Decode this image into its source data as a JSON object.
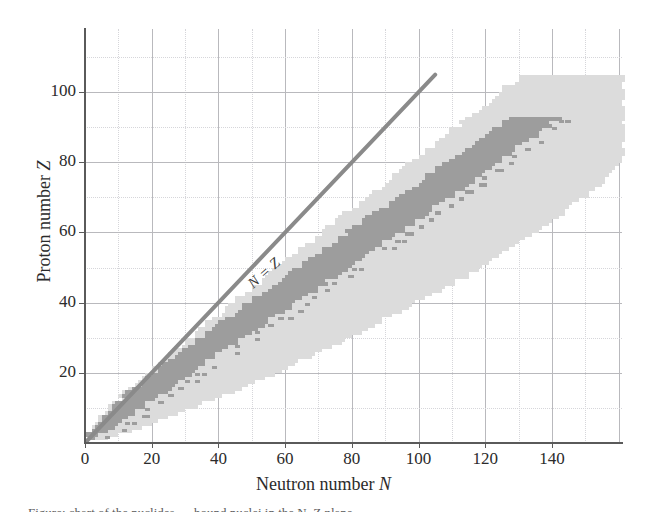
{
  "figure": {
    "background": "#ffffff",
    "caption_partial": "Figure: chart of the nuclides — bound nuclei in the N–Z plane"
  },
  "axes": {
    "x": {
      "title_text": "Neutron number ",
      "title_symbol": "N",
      "ticks": [
        0,
        20,
        40,
        60,
        80,
        100,
        120,
        140
      ],
      "tick_labels": [
        "0",
        "20",
        "40",
        "60",
        "80",
        "100",
        "120",
        "140"
      ],
      "range": [
        0,
        161
      ],
      "minor_step": 10
    },
    "y": {
      "title_text": "Proton number ",
      "title_symbol": "Z",
      "ticks": [
        20,
        40,
        60,
        80,
        100
      ],
      "tick_labels": [
        "20",
        "40",
        "60",
        "80",
        "100"
      ],
      "range": [
        0,
        118
      ],
      "minor_step": 10
    },
    "grid": {
      "major_color": "#b9b9bd",
      "minor_color": "#d6d6da",
      "major_step": 20,
      "enabled": true
    },
    "frame_color": "#5a5a5a"
  },
  "annotations": {
    "nz_line": {
      "label": "N = Z",
      "color": "#8a8a8a",
      "width_px": 4,
      "from": [
        0,
        0
      ],
      "to": [
        105,
        105
      ]
    }
  },
  "colors": {
    "stable_band": "#9d9d9d",
    "bound_region": "#dcdcdc",
    "text": "#2b2b2b"
  },
  "chart_data": {
    "type": "scatter",
    "title": "",
    "xlabel": "Neutron number N",
    "ylabel": "Proton number Z",
    "xlim": [
      0,
      161
    ],
    "ylim": [
      0,
      118
    ],
    "grid": true,
    "legend": "none",
    "annotations": [
      {
        "text": "N = Z",
        "type": "line",
        "slope": 1,
        "intercept": 0,
        "x_end": 105
      }
    ],
    "series": [
      {
        "name": "bound nuclei (drip-line region)",
        "color": "#dcdcdc",
        "marker": "square",
        "description": "Light grey squares spanning all theoretically bound nuclides between the proton and neutron drip lines.",
        "band": {
          "comment": "For each Z, the inclusive N range of light-grey cells.",
          "z_min": 1,
          "z_max": 104,
          "n_lower": [
            0,
            0,
            2,
            2,
            3,
            4,
            5,
            6,
            7,
            8,
            9,
            10,
            11,
            12,
            13,
            14,
            16,
            17,
            18,
            19,
            20,
            22,
            23,
            24,
            25,
            26,
            28,
            29,
            30,
            32,
            33,
            34,
            36,
            37,
            38,
            40,
            41,
            42,
            44,
            45,
            46,
            48,
            49,
            50,
            52,
            53,
            54,
            56,
            57,
            58,
            60,
            61,
            62,
            64,
            65,
            66,
            68,
            69,
            70,
            72,
            73,
            74,
            76,
            77,
            78,
            80,
            81,
            82,
            84,
            85,
            86,
            88,
            89,
            90,
            92,
            93,
            94,
            96,
            97,
            98,
            100,
            101,
            102,
            104,
            105,
            106,
            108,
            109,
            110,
            112,
            113,
            114,
            116,
            117,
            118,
            120,
            121,
            122,
            124,
            125,
            126,
            128,
            129,
            130
          ],
          "n_upper": [
            6,
            10,
            13,
            16,
            19,
            22,
            24,
            27,
            30,
            33,
            35,
            38,
            40,
            43,
            45,
            48,
            50,
            53,
            55,
            58,
            60,
            62,
            64,
            67,
            69,
            71,
            73,
            75,
            77,
            79,
            81,
            83,
            85,
            87,
            89,
            91,
            93,
            95,
            97,
            99,
            101,
            103,
            105,
            107,
            109,
            111,
            113,
            114,
            116,
            118,
            120,
            121,
            123,
            125,
            126,
            128,
            130,
            131,
            133,
            134,
            136,
            137,
            139,
            140,
            142,
            143,
            145,
            146,
            147,
            149,
            150,
            151,
            153,
            154,
            155,
            156,
            157,
            158,
            159,
            160,
            161,
            161,
            161,
            161,
            161,
            161,
            161,
            161,
            161,
            161,
            161,
            161,
            161,
            161,
            161,
            161,
            161,
            161,
            161,
            161,
            161,
            161,
            161,
            161
          ]
        }
      },
      {
        "name": "known / stable nuclei (valley of stability)",
        "color": "#9d9d9d",
        "marker": "square",
        "description": "Darker grey squares tracing the experimentally known / stable nuclides, deviating below N=Z for heavy elements.",
        "band": {
          "comment": "For each Z, the inclusive N range of dark-grey cells.",
          "z_min": 1,
          "z_max": 92,
          "n_lower": [
            0,
            1,
            2,
            3,
            4,
            5,
            6,
            7,
            8,
            9,
            10,
            11,
            12,
            13,
            14,
            16,
            17,
            18,
            20,
            21,
            22,
            23,
            25,
            26,
            28,
            29,
            30,
            32,
            33,
            35,
            36,
            38,
            39,
            41,
            42,
            44,
            45,
            47,
            48,
            50,
            51,
            53,
            54,
            56,
            57,
            59,
            60,
            62,
            63,
            65,
            66,
            68,
            69,
            71,
            72,
            74,
            75,
            76,
            78,
            79,
            81,
            82,
            84,
            85,
            87,
            88,
            90,
            91,
            93,
            94,
            96,
            97,
            99,
            100,
            102,
            103,
            105,
            106,
            108,
            109,
            111,
            112,
            114,
            115,
            117,
            118,
            120,
            121,
            123,
            124,
            126,
            127
          ],
          "n_upper": [
            2,
            4,
            6,
            8,
            9,
            11,
            12,
            14,
            15,
            17,
            18,
            20,
            21,
            23,
            24,
            26,
            27,
            29,
            30,
            32,
            33,
            35,
            36,
            38,
            39,
            41,
            42,
            44,
            45,
            47,
            48,
            50,
            52,
            53,
            55,
            56,
            58,
            60,
            61,
            63,
            64,
            66,
            68,
            69,
            71,
            72,
            74,
            76,
            77,
            79,
            80,
            82,
            83,
            85,
            86,
            88,
            89,
            91,
            92,
            94,
            95,
            97,
            98,
            100,
            101,
            103,
            104,
            106,
            107,
            109,
            110,
            112,
            113,
            115,
            116,
            118,
            119,
            121,
            122,
            124,
            125,
            127,
            128,
            129,
            131,
            132,
            134,
            135,
            136,
            138,
            139,
            141
          ]
        }
      }
    ]
  }
}
